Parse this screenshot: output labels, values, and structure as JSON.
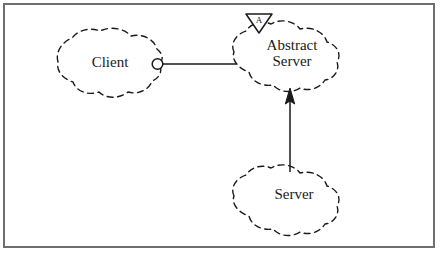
{
  "figure": {
    "kind": "uml-class-diagram",
    "border_color": "#6e6e6e",
    "background_color": "#ffffff",
    "line_color": "#1a1a1a"
  },
  "nodes": {
    "client": {
      "label": "Client",
      "shape": "hand-drawn-cloud",
      "stroke": "dashed"
    },
    "abstract_server": {
      "label": "Abstract\nServer",
      "shape": "hand-drawn-cloud",
      "stroke": "dashed",
      "stereotype_marker": "A",
      "marker_shape": "inverted-triangle"
    },
    "server": {
      "label": "Server",
      "shape": "hand-drawn-cloud",
      "stroke": "dashed"
    }
  },
  "connectors": {
    "client_to_abstract_server": {
      "kind": "association",
      "endpoint": "socket-circle",
      "stroke": "solid"
    },
    "server_to_abstract_server": {
      "kind": "generalization",
      "endpoint": "solid-arrowhead",
      "stroke": "solid",
      "direction": "up"
    }
  }
}
